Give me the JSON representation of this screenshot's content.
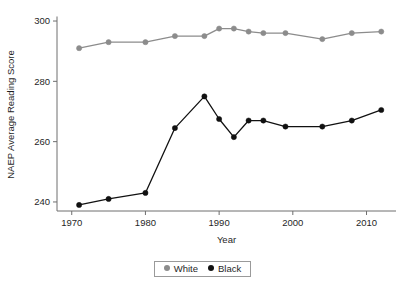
{
  "chart_data": {
    "type": "line",
    "title": "",
    "xlabel": "Year",
    "ylabel": "NAEP Average Reading Score",
    "xlim": [
      1968,
      2014
    ],
    "ylim": [
      237,
      301
    ],
    "grid": false,
    "legend_position": "bottom-center",
    "x_ticks": [
      1970,
      1980,
      1990,
      2000,
      2010
    ],
    "x_tick_labels": [
      "1970",
      "1980",
      "1990",
      "2000",
      "2010"
    ],
    "y_ticks": [
      240,
      260,
      280,
      300
    ],
    "y_tick_labels": [
      "240",
      "260",
      "280",
      "300"
    ],
    "x": [
      1971,
      1975,
      1980,
      1984,
      1988,
      1990,
      1992,
      1994,
      1996,
      1999,
      2004,
      2008,
      2012
    ],
    "series": [
      {
        "name": "White",
        "color": "#8c8c8c",
        "marker": "circle",
        "values": [
          291,
          293,
          293,
          295,
          295,
          297.5,
          297.5,
          296.5,
          296,
          296,
          294,
          296,
          296.5
        ]
      },
      {
        "name": "Black",
        "color": "#111111",
        "marker": "circle",
        "values": [
          239,
          241,
          243,
          264.5,
          275,
          267.5,
          261.5,
          267,
          267,
          265,
          265,
          267,
          270.5
        ]
      }
    ]
  },
  "legend": {
    "entries": [
      {
        "label": "White",
        "color": "#8c8c8c"
      },
      {
        "label": "Black",
        "color": "#111111"
      }
    ]
  },
  "axes": {
    "x_title": "Year",
    "y_title": "NAEP Average Reading Score"
  }
}
